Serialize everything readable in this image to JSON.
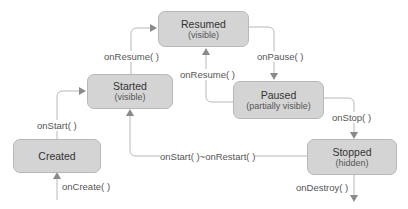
{
  "diagram": {
    "states": [
      {
        "id": "resumed",
        "title": "Resumed",
        "subtitle": "(visible)"
      },
      {
        "id": "started",
        "title": "Started",
        "subtitle": "(visible)"
      },
      {
        "id": "paused",
        "title": "Paused",
        "subtitle": "(partially visible)"
      },
      {
        "id": "created",
        "title": "Created",
        "subtitle": ""
      },
      {
        "id": "stopped",
        "title": "Stopped",
        "subtitle": "(hidden)"
      }
    ],
    "transitions": [
      {
        "label": "onCreate( )",
        "from": "",
        "to": "created"
      },
      {
        "label": "onStart( )",
        "from": "created",
        "to": "started"
      },
      {
        "label": "onResume( )",
        "from": "started",
        "to": "resumed"
      },
      {
        "label": "onPause( )",
        "from": "resumed",
        "to": "paused"
      },
      {
        "label": "onResume( )",
        "from": "paused",
        "to": "resumed"
      },
      {
        "label": "onStop( )",
        "from": "paused",
        "to": "stopped"
      },
      {
        "label": "onStart( )~onRestart( )",
        "from": "stopped",
        "to": "started"
      },
      {
        "label": "onDestroy( )",
        "from": "stopped",
        "to": ""
      }
    ],
    "colors": {
      "box_fill": "#d4d4d4",
      "box_border": "#b8b8b8",
      "line": "#b0b0b0",
      "arrow": "#8a8a8a"
    }
  }
}
